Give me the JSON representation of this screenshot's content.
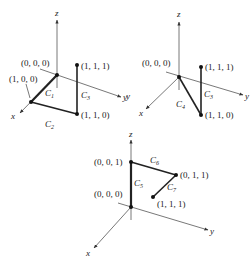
{
  "figure": {
    "panels": [
      {
        "id": "panel-1",
        "axes": {
          "x": "x",
          "y": "y",
          "z": "z"
        },
        "points": [
          {
            "label": "(0, 0, 0)"
          },
          {
            "label": "(1, 0, 0)"
          },
          {
            "label": "(1, 1, 1)"
          },
          {
            "label": "(1, 1, 0)"
          }
        ],
        "curves": [
          {
            "name": "C",
            "sub": "1",
            "from": "(0, 0, 0)",
            "to": "(1, 0, 0)"
          },
          {
            "name": "C",
            "sub": "2",
            "from": "(1, 0, 0)",
            "to": "(1, 1, 0)"
          },
          {
            "name": "C",
            "sub": "3",
            "from": "(1, 1, 0)",
            "to": "(1, 1, 1)"
          }
        ]
      },
      {
        "id": "panel-2",
        "axes": {
          "x": "x",
          "y": "y",
          "z": "z",
          "stray_y": "y"
        },
        "points": [
          {
            "label": "(0, 0, 0)"
          },
          {
            "label": "(1, 1, 1)"
          },
          {
            "label": "(1, 1, 0)"
          }
        ],
        "curves": [
          {
            "name": "C",
            "sub": "4",
            "from": "(0, 0, 0)",
            "to": "(1, 1, 0)"
          },
          {
            "name": "C",
            "sub": "3",
            "from": "(1, 1, 0)",
            "to": "(1, 1, 1)"
          }
        ]
      },
      {
        "id": "panel-3",
        "axes": {
          "x": "x",
          "y": "y",
          "z": "z"
        },
        "points": [
          {
            "label": "(0, 0, 1)"
          },
          {
            "label": "(0, 0, 0)"
          },
          {
            "label": "(0, 1, 1)"
          },
          {
            "label": "(1, 1, 1)"
          }
        ],
        "curves": [
          {
            "name": "C",
            "sub": "5",
            "from": "(0, 0, 0)",
            "to": "(0, 0, 1)"
          },
          {
            "name": "C",
            "sub": "6",
            "from": "(0, 0, 1)",
            "to": "(0, 1, 1)"
          },
          {
            "name": "C",
            "sub": "7",
            "from": "(0, 1, 1)",
            "to": "(1, 1, 1)"
          }
        ]
      }
    ]
  }
}
